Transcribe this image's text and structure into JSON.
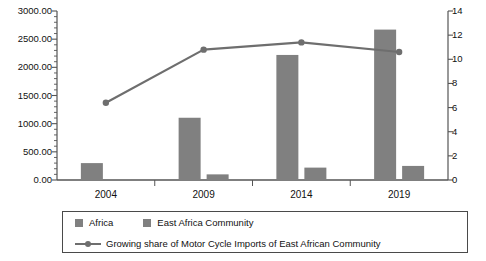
{
  "chart_data": {
    "type": "bar",
    "title": "",
    "subtitle": "",
    "xlabel": "",
    "ylabel": "",
    "categories": [
      "2004",
      "2009",
      "2014",
      "2019"
    ],
    "grid": false,
    "legend_position": "bottom",
    "axes": {
      "left": {
        "label": "",
        "min": 0,
        "max": 3000,
        "step": 500,
        "ticks": [
          "0.00",
          "500.00",
          "1000.00",
          "1500.00",
          "2000.00",
          "2500.00",
          "3000.00"
        ],
        "tick_values": [
          0,
          500,
          1000,
          1500,
          2000,
          2500,
          3000
        ],
        "minor_ticks": true
      },
      "right": {
        "label": "",
        "min": 0,
        "max": 14,
        "step": 2,
        "ticks": [
          "0",
          "2",
          "4",
          "6",
          "8",
          "10",
          "12",
          "14"
        ],
        "tick_values": [
          0,
          2,
          4,
          6,
          8,
          10,
          12,
          14
        ],
        "minor_ticks": false
      }
    },
    "series": [
      {
        "name": "Africa",
        "type": "bar",
        "axis": "left",
        "color": "#808080",
        "values": [
          300,
          1105,
          2220,
          2670
        ]
      },
      {
        "name": "East Africa Community",
        "type": "bar",
        "axis": "left",
        "color": "#808080",
        "values": [
          15,
          100,
          220,
          250
        ]
      },
      {
        "name": "Growing share of Motor Cycle Imports of East African Community",
        "type": "line",
        "axis": "right",
        "color": "#6e6e6e",
        "values": [
          6.4,
          10.8,
          11.4,
          10.6
        ]
      }
    ]
  },
  "legend": {
    "entries": [
      {
        "label": "Africa",
        "marker": "square-swatch"
      },
      {
        "label": "East Africa Community",
        "marker": "square-swatch"
      },
      {
        "label": "Growing share of Motor Cycle Imports of East African Community",
        "marker": "line-with-dot"
      }
    ]
  },
  "colors": {
    "bar": "#808080",
    "line": "#6e6e6e",
    "axis": "#555555",
    "text": "#111111",
    "legend_border": "#4a4a4a",
    "background": "#ffffff"
  }
}
